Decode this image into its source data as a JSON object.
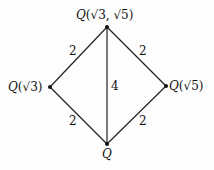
{
  "diagram": {
    "type": "field-extension-lattice",
    "nodes": [
      {
        "id": "top",
        "field": "Q",
        "args": "(√3, √5)"
      },
      {
        "id": "left",
        "field": "Q",
        "args": "(√3)"
      },
      {
        "id": "right",
        "field": "Q",
        "args": "(√5)"
      },
      {
        "id": "bottom",
        "field": "Q",
        "args": ""
      }
    ],
    "edges": [
      {
        "from": "left",
        "to": "top",
        "degree": "2"
      },
      {
        "from": "right",
        "to": "top",
        "degree": "2"
      },
      {
        "from": "bottom",
        "to": "left",
        "degree": "2"
      },
      {
        "from": "bottom",
        "to": "right",
        "degree": "2"
      },
      {
        "from": "bottom",
        "to": "top",
        "degree": "4"
      }
    ]
  }
}
